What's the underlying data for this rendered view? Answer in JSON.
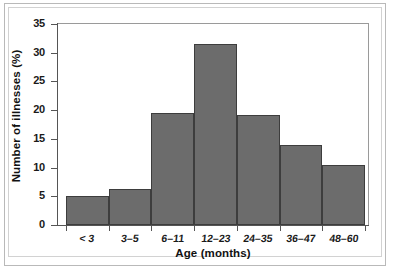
{
  "chart_data": {
    "type": "bar",
    "title": "",
    "xlabel": "Age (months)",
    "ylabel": "Number of illnesses (%)",
    "categories": [
      "< 3",
      "3–5",
      "6–11",
      "12–23",
      "24–35",
      "36–47",
      "48–60"
    ],
    "values": [
      5.0,
      6.3,
      19.5,
      31.5,
      19.2,
      13.9,
      10.5
    ],
    "ylim": [
      0,
      35
    ],
    "yticks": [
      0,
      5,
      10,
      15,
      20,
      25,
      30,
      35
    ],
    "ytick_labels": [
      "0",
      "5",
      "10",
      "15",
      "20",
      "25",
      "30",
      "35"
    ],
    "grid": false,
    "legend": null,
    "bar_color": "#6c6c6c",
    "bar_edge_color": "#3d3d3d",
    "axis_color": "#555555",
    "background_color": "#ffffff"
  }
}
